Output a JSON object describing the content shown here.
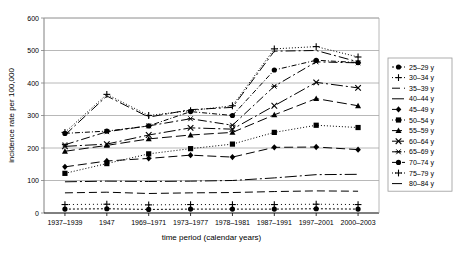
{
  "chart_data": {
    "type": "line",
    "title": "",
    "xlabel": "time period (calendar years)",
    "ylabel": "incidence rate per 100,000",
    "categories": [
      "1937–1939",
      "1947",
      "1969–1971",
      "1973–1977",
      "1978–1981",
      "1987–1991",
      "1997–2001",
      "2000–2003"
    ],
    "ylim": [
      0,
      600
    ],
    "yticks": [
      0,
      100,
      200,
      300,
      400,
      500,
      600
    ],
    "grid": "horizontal",
    "legend_position": "right",
    "series": [
      {
        "name": "25–29 y",
        "values": [
          12,
          13,
          11,
          12,
          12,
          12,
          13,
          12
        ],
        "marker": "circle-filled",
        "dash": "2,2"
      },
      {
        "name": "30–34 y",
        "values": [
          26,
          27,
          25,
          26,
          26,
          26,
          27,
          26
        ],
        "marker": "plus",
        "dash": "1,3"
      },
      {
        "name": "35–39 y",
        "values": [
          62,
          64,
          60,
          62,
          63,
          66,
          68,
          67
        ],
        "marker": "none",
        "dash": "8,4"
      },
      {
        "name": "40–44 y",
        "values": [
          96,
          98,
          97,
          98,
          100,
          108,
          118,
          119
        ],
        "marker": "none",
        "dash": "12,3,2,3"
      },
      {
        "name": "45–49 y",
        "values": [
          142,
          160,
          168,
          178,
          172,
          202,
          203,
          195
        ],
        "marker": "diamond-filled",
        "dash": "9,4"
      },
      {
        "name": "50–54 y",
        "values": [
          122,
          152,
          182,
          198,
          212,
          248,
          270,
          263
        ],
        "marker": "square-filled",
        "dash": "1,2"
      },
      {
        "name": "55–59 y",
        "values": [
          190,
          208,
          228,
          240,
          248,
          302,
          352,
          330
        ],
        "marker": "triangle-filled",
        "dash": "10,4"
      },
      {
        "name": "60–64 y",
        "values": [
          205,
          212,
          240,
          262,
          258,
          330,
          402,
          385
        ],
        "marker": "x",
        "dash": "12,3,2,3"
      },
      {
        "name": "65–69 y",
        "values": [
          210,
          250,
          268,
          290,
          270,
          390,
          465,
          462
        ],
        "marker": "asterisk",
        "dash": "9,3,2,3"
      },
      {
        "name": "70–74 y",
        "values": [
          245,
          252,
          268,
          312,
          300,
          440,
          470,
          463
        ],
        "marker": "circle-filled",
        "dash": "5,2,1,2"
      },
      {
        "name": "75–79 y",
        "values": [
          248,
          365,
          300,
          315,
          330,
          505,
          512,
          480
        ],
        "marker": "plus",
        "dash": "1,2"
      },
      {
        "name": "80–84 y",
        "values": [
          240,
          360,
          295,
          318,
          325,
          498,
          500,
          465
        ],
        "marker": "none",
        "dash": "10,3,2,3"
      }
    ]
  },
  "axis": {
    "y_ticks": [
      "0",
      "100",
      "200",
      "300",
      "400",
      "500",
      "600"
    ],
    "y_title": "incidence rate per 100,000",
    "x_title": "time period (calendar years)",
    "x_ticks": [
      "1937–1939",
      "1947",
      "1969–1971",
      "1973–1977",
      "1978–1981",
      "1987–1991",
      "1997–2001",
      "2000–2003"
    ]
  },
  "legend": {
    "items": [
      {
        "label": "25–29 y"
      },
      {
        "label": "30–34 y"
      },
      {
        "label": "35–39 y"
      },
      {
        "label": "40–44 y"
      },
      {
        "label": "45–49 y"
      },
      {
        "label": "50–54 y"
      },
      {
        "label": "55–59 y"
      },
      {
        "label": "60–64 y"
      },
      {
        "label": "65–69 y"
      },
      {
        "label": "70–74 y"
      },
      {
        "label": "75–79 y"
      },
      {
        "label": "80–84 y"
      }
    ]
  },
  "colors": {
    "line": "#000000",
    "grid": "#a6a6a6",
    "axis": "#808080",
    "background": "#ffffff"
  }
}
